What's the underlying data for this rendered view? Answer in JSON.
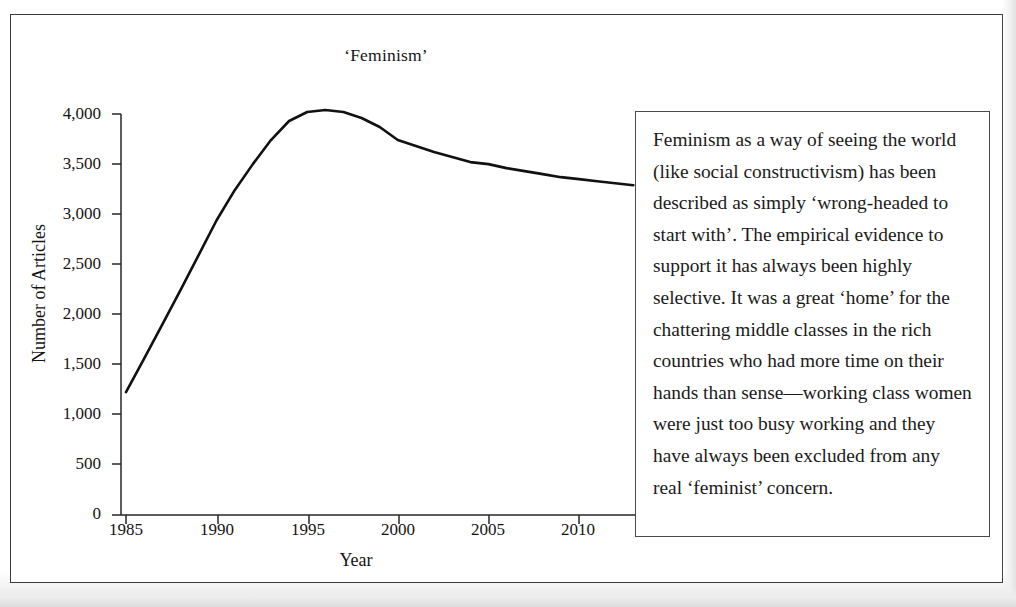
{
  "figure": {
    "title": "‘Feminism’",
    "annotation": "Feminism as a way of seeing the world (like social constructivism) has been described as simply ‘wrong-headed to start with’. The empirical evidence to support it has always been highly selective. It was a great ‘home’ for the chattering middle classes in the rich countries who had more time on their hands than sense—working class women were just too busy working and they have always been excluded from any real ‘feminist’ concern."
  },
  "chart_data": {
    "type": "line",
    "title": "‘Feminism’",
    "xlabel": "Year",
    "ylabel": "Number of Articles",
    "xlim": [
      1985,
      2013
    ],
    "ylim": [
      0,
      4000
    ],
    "grid": false,
    "legend": "none",
    "line_color": "#111111",
    "xticks": [
      1985,
      1990,
      1995,
      2000,
      2005,
      2010
    ],
    "xtick_labels": [
      "1985",
      "1990",
      "1995",
      "2000",
      "2005",
      "2010"
    ],
    "yticks": [
      0,
      500,
      1000,
      1500,
      2000,
      2500,
      3000,
      3500,
      4000
    ],
    "ytick_labels": [
      "0",
      "500",
      "1,000",
      "1,500",
      "2,000",
      "2,500",
      "3,000",
      "3,500",
      "4,000"
    ],
    "x": [
      1985,
      1986,
      1987,
      1988,
      1989,
      1990,
      1991,
      1992,
      1993,
      1994,
      1995,
      1996,
      1997,
      1998,
      1999,
      2000,
      2001,
      2002,
      2003,
      2004,
      2005,
      2006,
      2007,
      2008,
      2009,
      2010,
      2011,
      2012,
      2013
    ],
    "values": [
      1225,
      1560,
      1900,
      2240,
      2590,
      2940,
      3240,
      3500,
      3740,
      3930,
      4020,
      4040,
      4020,
      3960,
      3870,
      3740,
      3680,
      3620,
      3570,
      3520,
      3500,
      3460,
      3430,
      3400,
      3370,
      3350,
      3330,
      3310,
      3290
    ]
  }
}
